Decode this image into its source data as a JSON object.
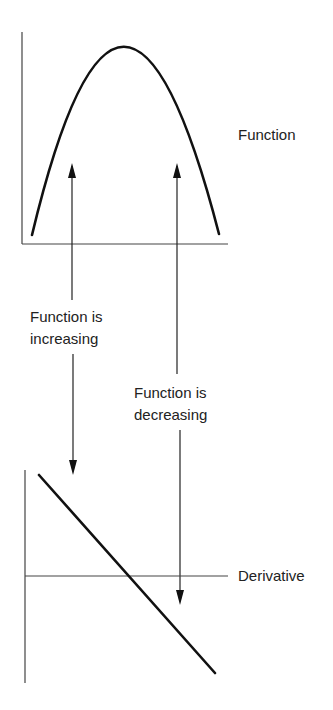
{
  "diagram": {
    "top_graph": {
      "label": "Function",
      "curve": "downward parabola",
      "peak": "maximum at center"
    },
    "bottom_graph": {
      "label": "Derivative",
      "curve": "straight line with negative slope crossing zero at the function's maximum"
    },
    "annotations": {
      "increasing_line1": "Function is",
      "increasing_line2": "increasing",
      "decreasing_line1": "Function is",
      "decreasing_line2": "decreasing"
    },
    "colors": {
      "line": "#111111",
      "thin_line": "#333333",
      "background": "#ffffff"
    }
  }
}
